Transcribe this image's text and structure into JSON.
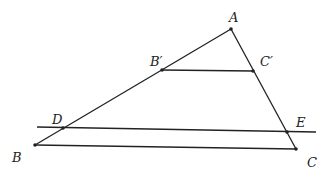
{
  "diagram": {
    "type": "geometry-triangle-with-parallel-lines",
    "points": {
      "A": {
        "label": "A",
        "x": 231,
        "y": 29
      },
      "B": {
        "label": "B",
        "x": 35,
        "y": 145
      },
      "C": {
        "label": "C",
        "x": 296,
        "y": 149
      },
      "B_prime": {
        "label": "B′",
        "x": 162,
        "y": 70
      },
      "C_prime": {
        "label": "C′",
        "x": 253,
        "y": 71
      },
      "D": {
        "label": "D",
        "x": 63,
        "y": 128
      },
      "E": {
        "label": "E",
        "x": 287,
        "y": 132
      }
    },
    "segments": [
      [
        "A",
        "B"
      ],
      [
        "A",
        "C"
      ],
      [
        "B",
        "C"
      ],
      [
        "B_prime",
        "C_prime"
      ]
    ],
    "lines": [
      {
        "through": [
          "D",
          "E"
        ],
        "x1": 37,
        "y1": 127,
        "x2": 316,
        "y2": 132
      }
    ]
  }
}
